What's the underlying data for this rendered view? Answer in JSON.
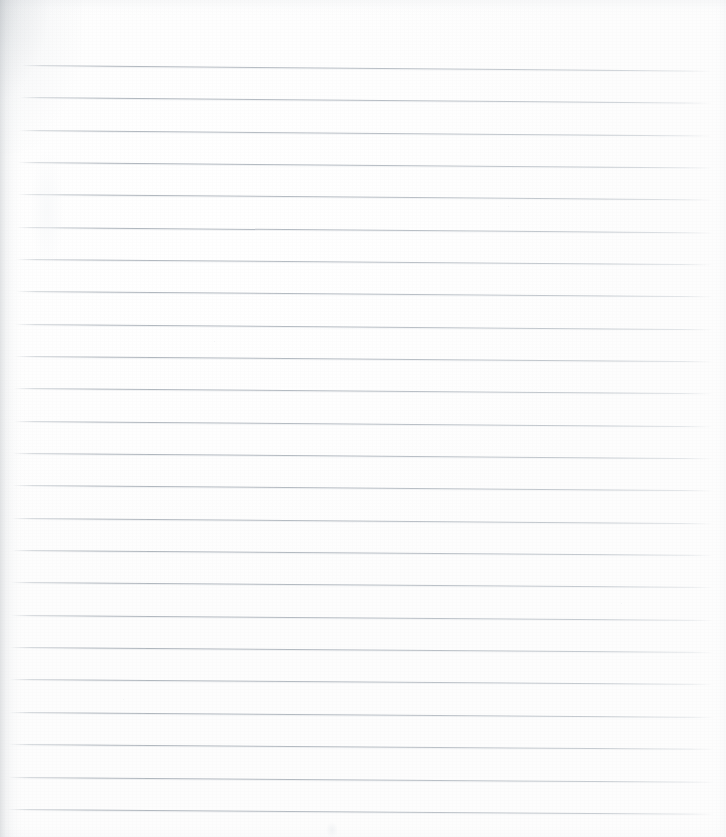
{
  "document": {
    "kind": "scanned-ruled-notebook-page",
    "title": "Blank Ruled Page",
    "caption": "Scanned blank lined notebook page",
    "width_px": 726,
    "height_px": 837,
    "background_color": "#ffffff",
    "has_visible_text": false,
    "text_content": ""
  },
  "paper": {
    "base_color": "#ffffff",
    "tint_color": "#fdfdfd",
    "grain_opacity": 0.55
  },
  "shadows": {
    "left_edge_color": "#a0a6ac",
    "top_left_curl_color": "#949ba2",
    "top_edge_color": "#d0d5da",
    "right_edge_color": "#e2e6ea",
    "bottom_edge_color": "#e8ecef"
  },
  "ruling": {
    "line_color": "#a8afb7",
    "line_color_faded": "#cbd1d7",
    "line_thickness_px": 1,
    "line_count": 24,
    "spacing_px": 32.3,
    "first_line_y_px": 65,
    "left_start_x_px": 14,
    "right_end_x_px": 713,
    "slope_deg": 0.45,
    "lines": [
      {
        "index": 1,
        "y": 65,
        "x_start": 22,
        "x_end": 711,
        "slope_deg": 0.48,
        "opacity": 0.92
      },
      {
        "index": 2,
        "y": 97,
        "x_start": 20,
        "x_end": 712,
        "slope_deg": 0.47,
        "opacity": 0.95
      },
      {
        "index": 3,
        "y": 130,
        "x_start": 19,
        "x_end": 712,
        "slope_deg": 0.46,
        "opacity": 0.93
      },
      {
        "index": 4,
        "y": 162,
        "x_start": 18,
        "x_end": 713,
        "slope_deg": 0.46,
        "opacity": 0.96
      },
      {
        "index": 5,
        "y": 194,
        "x_start": 18,
        "x_end": 713,
        "slope_deg": 0.45,
        "opacity": 0.94
      },
      {
        "index": 6,
        "y": 227,
        "x_start": 17,
        "x_end": 713,
        "slope_deg": 0.45,
        "opacity": 0.96
      },
      {
        "index": 7,
        "y": 259,
        "x_start": 16,
        "x_end": 713,
        "slope_deg": 0.44,
        "opacity": 0.93
      },
      {
        "index": 8,
        "y": 291,
        "x_start": 16,
        "x_end": 713,
        "slope_deg": 0.44,
        "opacity": 0.95
      },
      {
        "index": 9,
        "y": 324,
        "x_start": 15,
        "x_end": 713,
        "slope_deg": 0.44,
        "opacity": 0.94
      },
      {
        "index": 10,
        "y": 356,
        "x_start": 15,
        "x_end": 713,
        "slope_deg": 0.43,
        "opacity": 0.96
      },
      {
        "index": 11,
        "y": 388,
        "x_start": 14,
        "x_end": 713,
        "slope_deg": 0.43,
        "opacity": 0.95
      },
      {
        "index": 12,
        "y": 421,
        "x_start": 14,
        "x_end": 713,
        "slope_deg": 0.43,
        "opacity": 0.94
      },
      {
        "index": 13,
        "y": 453,
        "x_start": 13,
        "x_end": 713,
        "slope_deg": 0.42,
        "opacity": 0.96
      },
      {
        "index": 14,
        "y": 485,
        "x_start": 13,
        "x_end": 713,
        "slope_deg": 0.42,
        "opacity": 0.95
      },
      {
        "index": 15,
        "y": 518,
        "x_start": 12,
        "x_end": 713,
        "slope_deg": 0.42,
        "opacity": 0.94
      },
      {
        "index": 16,
        "y": 550,
        "x_start": 12,
        "x_end": 713,
        "slope_deg": 0.41,
        "opacity": 0.96
      },
      {
        "index": 17,
        "y": 582,
        "x_start": 11,
        "x_end": 713,
        "slope_deg": 0.41,
        "opacity": 0.95
      },
      {
        "index": 18,
        "y": 615,
        "x_start": 11,
        "x_end": 713,
        "slope_deg": 0.41,
        "opacity": 0.94
      },
      {
        "index": 19,
        "y": 647,
        "x_start": 10,
        "x_end": 713,
        "slope_deg": 0.4,
        "opacity": 0.96
      },
      {
        "index": 20,
        "y": 679,
        "x_start": 10,
        "x_end": 713,
        "slope_deg": 0.4,
        "opacity": 0.95
      },
      {
        "index": 21,
        "y": 712,
        "x_start": 9,
        "x_end": 714,
        "slope_deg": 0.4,
        "opacity": 0.96
      },
      {
        "index": 22,
        "y": 744,
        "x_start": 9,
        "x_end": 714,
        "slope_deg": 0.39,
        "opacity": 0.95
      },
      {
        "index": 23,
        "y": 777,
        "x_start": 8,
        "x_end": 714,
        "slope_deg": 0.39,
        "opacity": 0.96
      },
      {
        "index": 24,
        "y": 809,
        "x_start": 8,
        "x_end": 714,
        "slope_deg": 0.39,
        "opacity": 0.94
      }
    ]
  },
  "artifacts": {
    "smudges": [
      {
        "name": "bottom-center-smudge",
        "x": 326,
        "y": 822,
        "w": 12,
        "h": 16,
        "color": "#e9ecef",
        "opacity": 0.55
      },
      {
        "name": "upper-left-haze",
        "x": 30,
        "y": 150,
        "w": 34,
        "h": 120,
        "color": "#f1f3f5",
        "opacity": 0.4
      }
    ],
    "specks": [
      {
        "name": "speck-a",
        "x": 214,
        "y": 341,
        "d": 1,
        "color": "#dfe3e7",
        "opacity": 0.5
      },
      {
        "name": "speck-b",
        "x": 508,
        "y": 206,
        "d": 1,
        "color": "#e1e5e9",
        "opacity": 0.45
      },
      {
        "name": "speck-c",
        "x": 621,
        "y": 603,
        "d": 1,
        "color": "#e0e4e8",
        "opacity": 0.45
      },
      {
        "name": "speck-d",
        "x": 123,
        "y": 699,
        "d": 1,
        "color": "#e2e6ea",
        "opacity": 0.4
      }
    ]
  }
}
